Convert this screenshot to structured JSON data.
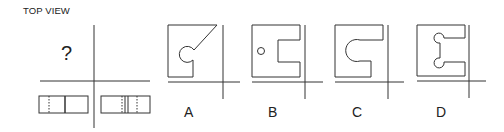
{
  "title": "TOP VIEW",
  "question_mark": "?",
  "given_views": {
    "front_view": {
      "description": "rectangle with one hidden (dashed) line left and one solid vertical line"
    },
    "side_view": {
      "description": "rectangle with two solid center lines flanked by dashed hidden lines"
    }
  },
  "options": [
    {
      "label": "A",
      "description": "square with circular notch and diagonal cut"
    },
    {
      "label": "B",
      "description": "square with rectangular slot and small circle hole"
    },
    {
      "label": "C",
      "description": "square with rounded (semicircular) slot"
    },
    {
      "label": "D",
      "description": "square with rectangular slot having two circular lobes"
    }
  ],
  "colors": {
    "line": "#333333",
    "background": "#ffffff"
  }
}
